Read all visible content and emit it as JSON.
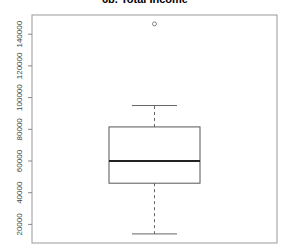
{
  "chart_data": {
    "type": "boxplot",
    "title": "6b. Total Income",
    "xlabel": "",
    "ylabel": "",
    "ylim": [
      9000,
      152000
    ],
    "yticks": [
      20000,
      40000,
      60000,
      80000,
      100000,
      120000,
      140000
    ],
    "ytick_labels": [
      "20000",
      "40000",
      "60000",
      "80000",
      "100000",
      "120000",
      "140000"
    ],
    "grid": false,
    "series": [
      {
        "name": "Total Income",
        "whisker_low": 14000,
        "q1": 46000,
        "median": 60000,
        "q3": 81500,
        "whisker_high": 95000,
        "outliers": [
          146500
        ]
      }
    ]
  },
  "colors": {
    "box": "#555555",
    "median": "#222222",
    "axis": "#888888"
  }
}
